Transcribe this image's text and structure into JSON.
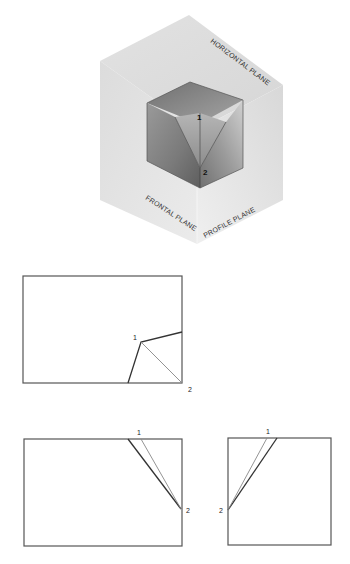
{
  "figure": {
    "isometric": {
      "planes": {
        "horizontal": "HORIZONTAL PLANE",
        "frontal": "FRONTAL PLANE",
        "profile": "PROFILE PLANE"
      },
      "points": {
        "p1": "1",
        "p2": "2"
      }
    },
    "views": {
      "top_view": {
        "name": "Top view (horizontal projection)",
        "p1": "1",
        "p2": "2"
      },
      "front_view": {
        "name": "Front view (frontal projection)",
        "p1": "1",
        "p2": "2"
      },
      "side_view": {
        "name": "Side view (profile projection)",
        "p1": "1",
        "p2": "2"
      }
    },
    "colors": {
      "plane_light": "#e6e6e6",
      "plane_mid": "#d9d9d9",
      "block_top": "#8a8a8a",
      "block_front": "#6e6e6e",
      "line_dark": "#333333",
      "line_gray": "#888888"
    }
  }
}
